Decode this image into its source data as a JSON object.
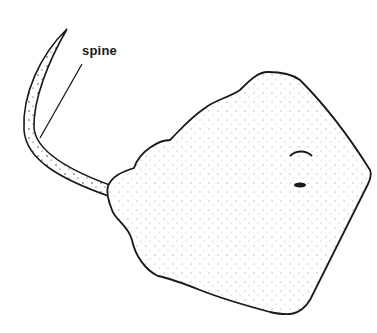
{
  "diagram": {
    "labels": [
      {
        "text": "spine",
        "target": "tail-spine"
      }
    ],
    "colors": {
      "ink": "#1a1a1a",
      "background": "#ffffff"
    }
  }
}
